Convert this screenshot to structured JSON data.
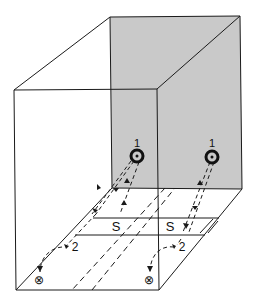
{
  "diagram": {
    "colors": {
      "shade": "#c9c9c9",
      "line": "#1a1a1a",
      "background": "#ffffff"
    },
    "labels": {
      "source_left": "1",
      "source_right": "1",
      "strip_left": "S",
      "strip_right": "S",
      "point_left": "2",
      "point_right": "2",
      "sink_left": "⊗",
      "sink_right": "⊗"
    },
    "icons": {
      "source": "dot-in-circle",
      "sink": "circled-x"
    }
  }
}
